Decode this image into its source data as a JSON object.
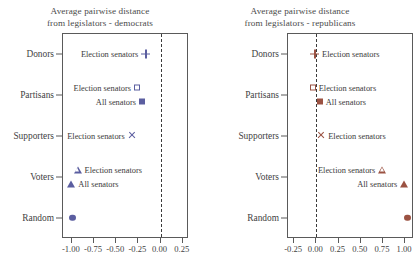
{
  "chart_data": {
    "type": "scatter",
    "title": "Average pairwise distance from legislators",
    "panels": [
      {
        "id": "democrats",
        "title_line1": "Average pairwise distance",
        "title_line2": "from legislators - democrats",
        "color": "#5b5ea0",
        "categories": [
          "Donors",
          "Partisans",
          "Supporters",
          "Voters",
          "Random"
        ],
        "xlabel": "",
        "ylabel": "",
        "xlim": [
          -1.1,
          0.32
        ],
        "xticks": [
          -1.0,
          -0.75,
          -0.5,
          -0.25,
          0.0,
          0.25
        ],
        "xtick_labels": [
          "-1.00",
          "-0.75",
          "-0.50",
          "-0.25",
          "0.00",
          "0.25"
        ],
        "grid": false,
        "zero_line": 0.0,
        "points": [
          {
            "category": "Donors",
            "series": "Election senators",
            "value": -0.16,
            "marker": "plus",
            "fill": "none",
            "label": "Election senators",
            "label_side": "left"
          },
          {
            "category": "Partisans",
            "series": "Election senators",
            "value": -0.26,
            "marker": "square",
            "fill": "none",
            "label": "Election senators",
            "label_side": "left"
          },
          {
            "category": "Partisans",
            "series": "All senators",
            "value": -0.2,
            "marker": "square",
            "fill": "solid",
            "label": "All senators",
            "label_side": "left"
          },
          {
            "category": "Supporters",
            "series": "Election senators",
            "value": -0.32,
            "marker": "cross",
            "fill": "none",
            "label": "Election senators",
            "label_side": "left"
          },
          {
            "category": "Voters",
            "series": "Election senators",
            "value": -0.93,
            "marker": "triangle",
            "fill": "none",
            "label": "Election senators",
            "label_side": "right"
          },
          {
            "category": "Voters",
            "series": "All senators",
            "value": -1.0,
            "marker": "triangle",
            "fill": "solid",
            "label": "All senators",
            "label_side": "right"
          },
          {
            "category": "Random",
            "series": "Random",
            "value": -0.98,
            "marker": "circle",
            "fill": "solid",
            "label": "",
            "label_side": "right"
          }
        ]
      },
      {
        "id": "republicans",
        "title_line1": "Average pairwise distance",
        "title_line2": "from legislators - republicans",
        "color": "#9b5242",
        "categories": [
          "Donors",
          "Partisans",
          "Supporters",
          "Voters",
          "Random"
        ],
        "xlabel": "",
        "ylabel": "",
        "xlim": [
          -0.32,
          1.1
        ],
        "xticks": [
          -0.25,
          0.0,
          0.25,
          0.5,
          0.75,
          1.0
        ],
        "xtick_labels": [
          "-0.25",
          "0.00",
          "0.25",
          "0.50",
          "0.75",
          "1.00"
        ],
        "grid": false,
        "zero_line": 0.0,
        "points": [
          {
            "category": "Donors",
            "series": "Election senators",
            "value": -0.02,
            "marker": "plus",
            "fill": "none",
            "label": "Election senators",
            "label_side": "right"
          },
          {
            "category": "Partisans",
            "series": "Election senators",
            "value": -0.02,
            "marker": "square",
            "fill": "none",
            "label": "Election senators",
            "label_side": "right"
          },
          {
            "category": "Partisans",
            "series": "All senators",
            "value": 0.06,
            "marker": "square",
            "fill": "solid",
            "label": "All senators",
            "label_side": "right"
          },
          {
            "category": "Supporters",
            "series": "Election senators",
            "value": 0.06,
            "marker": "cross",
            "fill": "none",
            "label": "Election senators",
            "label_side": "right"
          },
          {
            "category": "Voters",
            "series": "Election senators",
            "value": 0.75,
            "marker": "triangle",
            "fill": "none",
            "label": "Election senators",
            "label_side": "left"
          },
          {
            "category": "Voters",
            "series": "All senators",
            "value": 1.0,
            "marker": "triangle",
            "fill": "solid",
            "label": "All senators",
            "label_side": "left"
          },
          {
            "category": "Random",
            "series": "Random",
            "value": 1.04,
            "marker": "circle",
            "fill": "solid",
            "label": "",
            "label_side": "left"
          }
        ]
      }
    ]
  }
}
